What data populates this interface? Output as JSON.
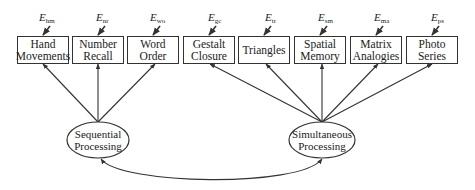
{
  "diagram": {
    "type": "structural-equation-model",
    "colors": {
      "line": "#333333",
      "text": "#222222",
      "background": "#ffffff"
    },
    "observed": [
      {
        "id": "hm",
        "line1": "Hand",
        "line2": "Movements",
        "error": "E",
        "error_sub": "hm"
      },
      {
        "id": "nr",
        "line1": "Number",
        "line2": "Recall",
        "error": "E",
        "error_sub": "nr"
      },
      {
        "id": "wo",
        "line1": "Word",
        "line2": "Order",
        "error": "E",
        "error_sub": "wo"
      },
      {
        "id": "gc",
        "line1": "Gestalt",
        "line2": "Closure",
        "error": "E",
        "error_sub": "gc"
      },
      {
        "id": "tr",
        "line1": "Triangles",
        "line2": "",
        "error": "E",
        "error_sub": "tr"
      },
      {
        "id": "sm",
        "line1": "Spatial",
        "line2": "Memory",
        "error": "E",
        "error_sub": "sm"
      },
      {
        "id": "ma",
        "line1": "Matrix",
        "line2": "Analogies",
        "error": "E",
        "error_sub": "ma"
      },
      {
        "id": "ps",
        "line1": "Photo",
        "line2": "Series",
        "error": "E",
        "error_sub": "ps"
      }
    ],
    "latent": [
      {
        "id": "seq",
        "line1": "Sequential",
        "line2": "Processing",
        "indicators": [
          "hm",
          "nr",
          "wo"
        ]
      },
      {
        "id": "sim",
        "line1": "Simultaneous",
        "line2": "Processing",
        "indicators": [
          "gc",
          "tr",
          "sm",
          "ma",
          "ps"
        ]
      }
    ],
    "correlation": {
      "from": "seq",
      "to": "sim",
      "type": "double-headed-curved-arrow"
    }
  }
}
